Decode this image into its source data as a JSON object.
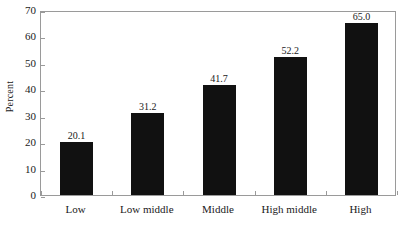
{
  "chart_data": {
    "type": "bar",
    "title": "",
    "xlabel": "",
    "ylabel": "Percent",
    "categories": [
      "Low",
      "Low middle",
      "Middle",
      "High middle",
      "High"
    ],
    "values": [
      20.1,
      31.2,
      41.7,
      52.2,
      65.0
    ],
    "value_labels": [
      "20.1",
      "31.2",
      "41.7",
      "52.2",
      "65.0"
    ],
    "ylim": [
      0,
      70
    ],
    "ytick_step": 10,
    "yticks": [
      70,
      60,
      50,
      40,
      30,
      20,
      10,
      0
    ],
    "ytick_labels": [
      "70",
      "60",
      "50",
      "40",
      "30",
      "20",
      "10",
      "0"
    ],
    "grid": false,
    "legend": null,
    "bar_color": "#111111",
    "frame_color": "#9a9a9a",
    "background": "#ffffff",
    "series": [
      {
        "name": "Percent",
        "values": [
          20.1,
          31.2,
          41.7,
          52.2,
          65.0
        ]
      }
    ]
  }
}
